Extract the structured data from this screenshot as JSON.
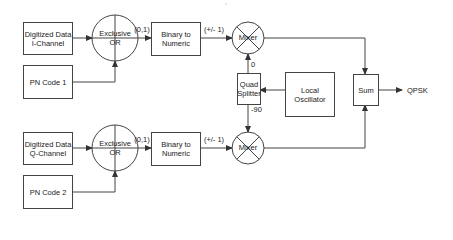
{
  "diagram": {
    "i_channel": {
      "data_block": "Digitized Data\nI-Channel",
      "pn_block": "PN Code 1",
      "xor_label": "Exclusive\nOR",
      "xor_output": "(0,1)",
      "converter_block": "Binary to\nNumeric",
      "converter_output": "(+/- 1)",
      "mixer_label": "Mixer",
      "phase_label": "0"
    },
    "q_channel": {
      "data_block": "Digitized Data\nQ-Channel",
      "pn_block": "PN Code 2",
      "xor_label": "Exclusive\nOR",
      "xor_output": "(0,1)",
      "converter_block": "Binary to\nNumeric",
      "converter_output": "(+/- 1)",
      "mixer_label": "Mixer",
      "phase_label": "-90"
    },
    "quad_splitter": "Quad\nSplitter",
    "local_oscillator": "Local\nOscillator",
    "sum_block": "Sum",
    "output_label": "QPSK",
    "colors": {
      "line": "#444444",
      "text": "#222222",
      "background": "#ffffff"
    }
  }
}
